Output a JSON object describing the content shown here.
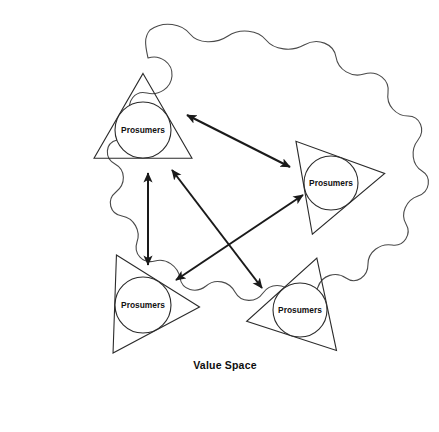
{
  "diagram": {
    "title": "Value Space",
    "space_label": "Value Space",
    "space_label_position": {
      "x": 225,
      "y": 366
    },
    "background_color": "#ffffff",
    "stroke_color": "#2b2b2b",
    "boundary_stroke_color": "#4a4a4a",
    "link_color": "#1a1a1a",
    "boundary": {
      "name": "value-space-boundary",
      "shape": "wavy-scalloped-closed-curve",
      "path": "M 150 30 C 164 20 182 24 190 34 C 198 44 216 44 228 36 C 240 28 258 30 266 40 C 274 50 292 52 304 45 C 318 37 334 44 336 57 C 338 70 352 78 364 74 C 378 70 390 80 388 93 C 386 105 396 116 408 116 C 420 116 426 130 418 140 C 410 150 412 165 422 171 C 432 177 430 192 418 196 C 406 200 400 214 406 224 C 412 234 404 247 392 245 C 380 243 368 252 368 264 C 368 277 356 285 346 278 C 336 271 322 275 318 287 C 314 299 300 303 292 293 C 284 283 270 283 263 293 C 256 303 241 303 235 292 C 229 281 215 278 206 286 C 196 294 182 290 180 278 C 178 266 166 258 155 261 C 143 264 133 254 137 242 C 141 231 134 218 122 216 C 110 214 106 200 116 192 C 126 184 126 170 115 164 C 104 158 105 143 117 140 C 129 137 136 124 131 113 C 126 102 135 90 147 93 C 159 96 171 88 172 76 C 173 63 160 54 148 58 C 146 48 143 38 150 30 Z"
    },
    "nodes": [
      {
        "id": "node-top-left",
        "label": "Prosumers",
        "cx": 143,
        "cy": 130,
        "r": 28,
        "triangle_rotation": 0
      },
      {
        "id": "node-right",
        "label": "Prosumers",
        "cx": 331,
        "cy": 183,
        "r": 27,
        "triangle_rotation": 200
      },
      {
        "id": "node-bottom-left",
        "label": "Prosumers",
        "cx": 143,
        "cy": 305,
        "r": 28,
        "triangle_rotation": 92
      },
      {
        "id": "node-bottom-right",
        "label": "Prosumers",
        "cx": 300,
        "cy": 310,
        "r": 27,
        "triangle_rotation": 18
      }
    ],
    "links": [
      {
        "id": "link-top-left-to-right",
        "from": "node-top-left",
        "to": "node-right",
        "x1": 187,
        "y1": 115,
        "x2": 290,
        "y2": 167,
        "arrow_start": true,
        "arrow_end": true
      },
      {
        "id": "link-top-left-to-bottom-left",
        "from": "node-top-left",
        "to": "node-bottom-left",
        "x1": 148,
        "y1": 173,
        "x2": 148,
        "y2": 265,
        "arrow_start": true,
        "arrow_end": true
      },
      {
        "id": "link-top-left-to-bottom-right",
        "from": "node-top-left",
        "to": "node-bottom-right",
        "x1": 172,
        "y1": 170,
        "x2": 262,
        "y2": 288,
        "arrow_start": true,
        "arrow_end": true
      },
      {
        "id": "link-bottom-left-to-right",
        "from": "node-bottom-left",
        "to": "node-right",
        "x1": 176,
        "y1": 280,
        "x2": 303,
        "y2": 195,
        "arrow_start": true,
        "arrow_end": true
      }
    ]
  }
}
